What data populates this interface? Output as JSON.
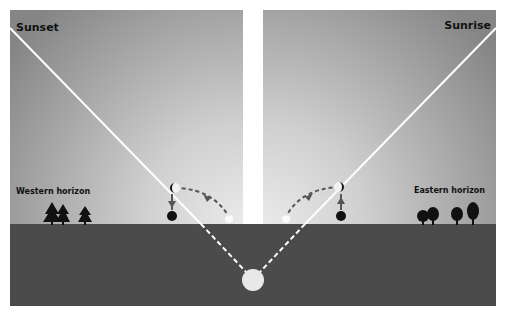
{
  "diagram": {
    "left_panel": {
      "title": "Sunset",
      "horizon_label": "Western horizon"
    },
    "right_panel": {
      "title": "Sunrise",
      "horizon_label": "Eastern horizon"
    },
    "elements": {
      "sun": "sun-below-horizon",
      "sight_lines": [
        "sunset-line",
        "sunrise-line"
      ],
      "moon_markers": [
        "crescent-moon",
        "new-moon",
        "full-moon-small"
      ],
      "trees_left": 3,
      "trees_right": 4
    },
    "colors": {
      "sky_dark": "#8a8a8a",
      "sky_light": "#e6e6e6",
      "ground": "#4b4b4b",
      "line": "#ffffff",
      "arrow": "#555555",
      "moon_dark": "#111111",
      "sun": "#e8e8e8",
      "divider": "#ffffff"
    }
  }
}
